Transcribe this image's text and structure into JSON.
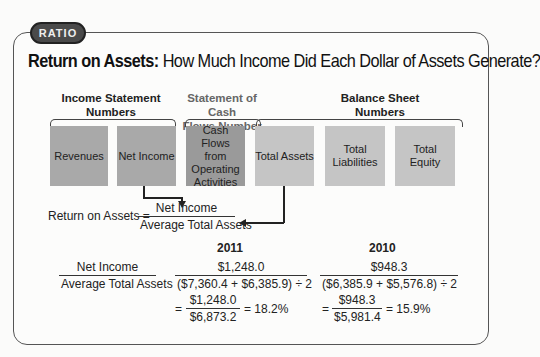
{
  "badge": "RATIO",
  "title": {
    "bold": "Return on Assets:",
    "rest": " How Much Income Did Each Dollar of Assets Generate?"
  },
  "groups": {
    "income_statement": [
      "Income Statement",
      "Numbers"
    ],
    "cash_flows": [
      "Statement of Cash",
      "Flows Number"
    ],
    "balance_sheet": [
      "Balance Sheet",
      "Numbers"
    ]
  },
  "boxes": [
    {
      "label": "Revenues"
    },
    {
      "label": "Net Income"
    },
    {
      "label": "Cash Flows from Operating Activities"
    },
    {
      "label": "Total Assets"
    },
    {
      "label": "Total Liabilities"
    },
    {
      "label": "Total Equity"
    }
  ],
  "formula": {
    "lhs": "Return on Assets =",
    "numerator": "Net Income",
    "denominator": "Average Total Assets"
  },
  "calc": {
    "label_num": "Net Income",
    "label_den": "Average Total Assets",
    "years": [
      {
        "year": "2011",
        "num": "$1,248.0",
        "den": "($7,360.4 + $6,385.9) ÷ 2",
        "res_num": "$1,248.0",
        "res_den": "$6,873.2",
        "result": "= 18.2%"
      },
      {
        "year": "2010",
        "num": "$948.3",
        "den": "($6,385.9 + $5,576.8) ÷ 2",
        "res_num": "$948.3",
        "res_den": "$5,981.4",
        "result": "= 15.9%"
      }
    ]
  }
}
